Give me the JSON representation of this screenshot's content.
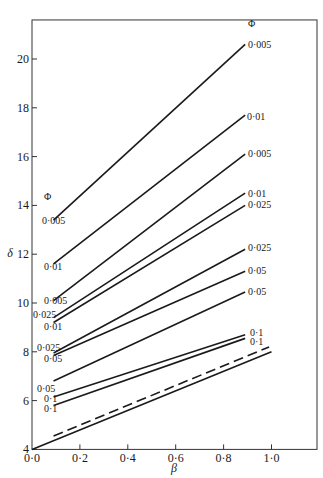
{
  "chart_data": {
    "type": "line",
    "title": "",
    "xlabel": "β",
    "ylabel": "δ",
    "xlim": [
      0.0,
      1.19
    ],
    "ylim": [
      4,
      21.6
    ],
    "grid": false,
    "legend": "none (inline line labels with Φ values)",
    "x_ticks": [
      "0·0",
      "0·2",
      "0·4",
      "0·6",
      "0·8",
      "1·0"
    ],
    "x_tick_values": [
      0.0,
      0.2,
      0.4,
      0.6,
      0.8,
      1.0
    ],
    "y_ticks": [
      "4",
      "6",
      "8",
      "10",
      "12",
      "14",
      "16",
      "18",
      "20"
    ],
    "y_tick_values": [
      4,
      6,
      8,
      10,
      12,
      14,
      16,
      18,
      20
    ],
    "left_group_header": "Φ",
    "right_group_header": "Φ",
    "annotations": [
      {
        "text": "Φ",
        "position": "left-header",
        "beta": 0.06,
        "delta": 14.2
      },
      {
        "text": "Φ",
        "position": "right-header",
        "beta": 0.93,
        "delta": 21.3
      }
    ],
    "series": [
      {
        "name": "0·005 (left) → 0·005 (right)",
        "left_label": "0·005",
        "right_label": "0·005",
        "style": "solid",
        "x": [
          0.09,
          0.89
        ],
        "y": [
          13.4,
          20.6
        ]
      },
      {
        "name": "0·01 → 0·01",
        "left_label": "0·01",
        "right_label": "0·01",
        "style": "solid",
        "x": [
          0.09,
          0.89
        ],
        "y": [
          11.6,
          17.7
        ]
      },
      {
        "name": "0·005 → 0·005",
        "left_label": "0·005",
        "right_label": "0·005",
        "style": "solid",
        "x": [
          0.09,
          0.89
        ],
        "y": [
          10.1,
          16.1
        ]
      },
      {
        "name": "0·025 → 0·01",
        "left_label": "0·025",
        "right_label": "0·01",
        "style": "solid",
        "x": [
          0.09,
          0.89
        ],
        "y": [
          9.4,
          14.5
        ]
      },
      {
        "name": "0·01 → 0·025",
        "left_label": "0·01",
        "right_label": "0·025",
        "style": "solid",
        "x": [
          0.09,
          0.89
        ],
        "y": [
          9.2,
          14.0
        ]
      },
      {
        "name": "0·025 → 0·025",
        "left_label": "0·025",
        "right_label": "0·025",
        "style": "solid",
        "x": [
          0.09,
          0.89
        ],
        "y": [
          7.95,
          12.2
        ]
      },
      {
        "name": "0·05 → 0·05",
        "left_label": "0·05",
        "right_label": "0·05",
        "style": "solid",
        "x": [
          0.09,
          0.89
        ],
        "y": [
          7.85,
          11.3
        ]
      },
      {
        "name": "0·05 → 0·05 (lower)",
        "left_label": "0·05",
        "right_label": "0·05",
        "style": "solid",
        "x": [
          0.09,
          0.89
        ],
        "y": [
          6.8,
          10.45
        ]
      },
      {
        "name": "0·1 → 0·1",
        "left_label": "0·1",
        "right_label": "0·1",
        "style": "solid",
        "x": [
          0.09,
          0.89
        ],
        "y": [
          6.15,
          8.7
        ]
      },
      {
        "name": "0·1 → 0·1 (lower)",
        "left_label": "0·1",
        "right_label": "0·1",
        "style": "solid",
        "x": [
          0.09,
          0.89
        ],
        "y": [
          5.8,
          8.55
        ]
      },
      {
        "name": "dashed reference",
        "left_label": "",
        "right_label": "",
        "style": "dashed",
        "x": [
          0.09,
          0.99
        ],
        "y": [
          4.55,
          8.2
        ]
      },
      {
        "name": "solid reference",
        "left_label": "",
        "right_label": "",
        "style": "solid",
        "x": [
          0.0,
          1.0
        ],
        "y": [
          4.0,
          8.0
        ]
      }
    ]
  },
  "labels": {
    "xlabel": "β",
    "ylabel": "δ"
  },
  "colors": {
    "line": "#1a1a1a",
    "axis": "#333333",
    "background": "#ffffff"
  }
}
